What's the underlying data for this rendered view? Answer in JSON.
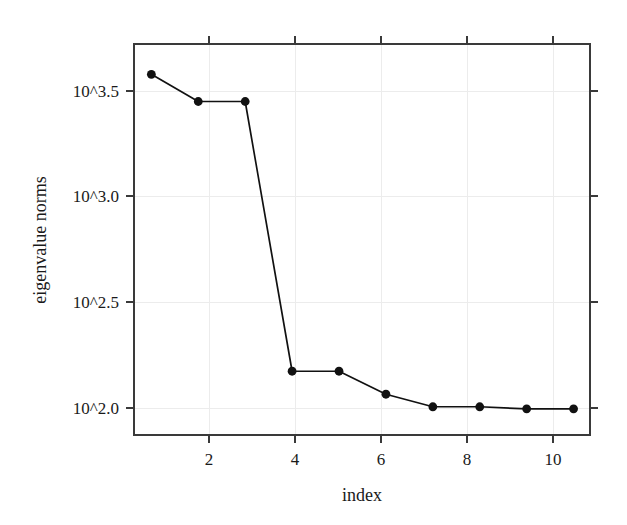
{
  "chart_data": {
    "type": "line",
    "title": "",
    "xlabel": "index",
    "ylabel": "eigenvalue norms",
    "x": [
      1,
      2,
      3,
      4,
      5,
      6,
      7,
      8,
      9,
      10
    ],
    "values": [
      3.6,
      3.47,
      3.47,
      2.18,
      2.18,
      2.07,
      2.01,
      2.01,
      2.0,
      2.0
    ],
    "series": [
      {
        "name": "eigenvalue norms",
        "values": [
          3.6,
          3.47,
          3.47,
          2.18,
          2.18,
          2.07,
          2.01,
          2.01,
          2.0,
          2.0
        ]
      }
    ],
    "y_scale": "log10-exponent",
    "y_tick_values": [
      3.5,
      3.0,
      2.5,
      2.0
    ],
    "y_tick_labels": [
      "10^3.5",
      "10^3.0",
      "10^2.5",
      "10^2.0"
    ],
    "x_tick_values": [
      2,
      4,
      6,
      8,
      10
    ],
    "x_tick_labels": [
      "2",
      "4",
      "6",
      "8",
      "10"
    ],
    "xlim": [
      0.63,
      10.35
    ],
    "ylim": [
      1.875,
      3.745
    ],
    "grid": true,
    "legend": null,
    "marker": "filled-circle",
    "line_color": "#111111",
    "marker_color": "#111111",
    "grid_color": "#ececec",
    "axis_color": "#3a3a3a",
    "background_color": "#ffffff"
  },
  "axes": {
    "x_title": "index",
    "y_title": "eigenvalue norms"
  },
  "ticks": {
    "y": [
      {
        "label": "10^3.5"
      },
      {
        "label": "10^3.0"
      },
      {
        "label": "10^2.5"
      },
      {
        "label": "10^2.0"
      }
    ],
    "x": [
      {
        "label": "2"
      },
      {
        "label": "4"
      },
      {
        "label": "6"
      },
      {
        "label": "8"
      },
      {
        "label": "10"
      }
    ]
  }
}
